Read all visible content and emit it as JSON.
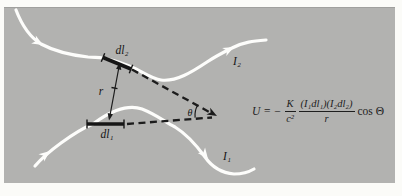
{
  "figure": {
    "panel_color": "#b2b2b0",
    "page_color": "#fbfbf8",
    "wire_color": "#fdfdfb",
    "ink_color": "#1c1c1c"
  },
  "labels": {
    "dl2": "dl₂",
    "dl1": "dl₁",
    "r": "r",
    "theta": "θ",
    "I2": "I₂",
    "I1": "I₁"
  },
  "formula": {
    "lhs": "U = −",
    "frac1_num": "K",
    "frac1_den": "c²",
    "frac2_num": "(I₁dl₁)(I₂dl₂)",
    "frac2_den": "r",
    "rhs": "cos Θ"
  }
}
